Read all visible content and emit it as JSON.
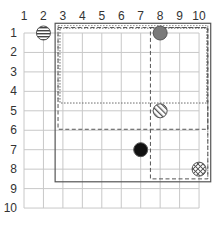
{
  "grid": {
    "columns": [
      "1",
      "2",
      "3",
      "4",
      "5",
      "6",
      "7",
      "8",
      "9",
      "10"
    ],
    "rows": [
      "1",
      "2",
      "3",
      "4",
      "5",
      "6",
      "7",
      "8",
      "9",
      "10"
    ],
    "origin_x": 24,
    "origin_y": 33,
    "spacing": 19.45,
    "line_color": "#c8c8c8",
    "label_color": "#333333"
  },
  "rectangles": [
    {
      "name": "outer-solid-rect",
      "x1": 2.6,
      "y1": 0.5,
      "x2": 10.6,
      "y2": 8.65,
      "style": "solid",
      "color": "#555555",
      "width": 1.2
    },
    {
      "name": "outer-double-rect-inner",
      "x1": 2.75,
      "y1": 0.62,
      "x2": 10.45,
      "y2": 0.62,
      "style": "double-top",
      "color": "#888888",
      "width": 1
    },
    {
      "name": "dotted-rect",
      "x1": 2.85,
      "y1": 0.75,
      "x2": 10.4,
      "y2": 4.6,
      "style": "dotted",
      "color": "#666666",
      "width": 1
    },
    {
      "name": "dashed-rect-wide",
      "x1": 2.75,
      "y1": 0.72,
      "x2": 10.45,
      "y2": 5.95,
      "style": "dashed",
      "color": "#555555",
      "width": 1
    },
    {
      "name": "dashed-rect-tall",
      "x1": 7.5,
      "y1": 0.72,
      "x2": 10.45,
      "y2": 8.5,
      "style": "dashed",
      "color": "#555555",
      "width": 1
    }
  ],
  "markers": [
    {
      "name": "horizontal-striped-circle",
      "col": 2,
      "row": 1,
      "pattern": "hstripe"
    },
    {
      "name": "gray-filled-circle",
      "col": 8,
      "row": 1,
      "pattern": "gray"
    },
    {
      "name": "diagonal-striped-circle",
      "col": 8,
      "row": 5,
      "pattern": "dstripe"
    },
    {
      "name": "black-filled-circle",
      "col": 7,
      "row": 7,
      "pattern": "black"
    },
    {
      "name": "crosshatch-circle",
      "col": 10,
      "row": 8,
      "pattern": "crosshatch"
    }
  ],
  "marker_radius": 7,
  "colors": {
    "gray_fill": "#7a7a7a",
    "black_fill": "#111111",
    "stroke": "#555555"
  }
}
